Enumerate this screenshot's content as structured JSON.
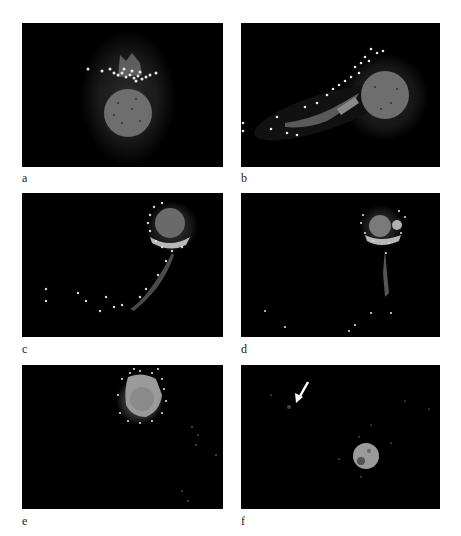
{
  "figure": {
    "panels": [
      {
        "id": "a",
        "label": "a",
        "box": {
          "x": 22,
          "y": 23,
          "w": 201,
          "h": 144
        },
        "disk": {
          "cx": 106,
          "cy": 90,
          "r": 24,
          "halo": 46,
          "fill": "#6e6e6e"
        },
        "secondary": {
          "cx": 106,
          "cy": 38,
          "r": 12,
          "fill": "#5a5a5a"
        },
        "description": "Central gray disk with halo; smaller body above with band of white particles"
      },
      {
        "id": "b",
        "label": "b",
        "box": {
          "x": 241,
          "y": 23,
          "w": 199,
          "h": 144
        },
        "disk": {
          "cx": 144,
          "cy": 72,
          "r": 24,
          "halo": 42,
          "fill": "#6e6e6e"
        },
        "description": "Disk with elongated tidal tail of particles extending to the left"
      },
      {
        "id": "c",
        "label": "c",
        "box": {
          "x": 22,
          "y": 193,
          "w": 201,
          "h": 144
        },
        "disk": {
          "cx": 146,
          "cy": 32,
          "r": 15,
          "halo": 24,
          "fill": "#6a6a6a"
        },
        "description": "Disk with bright crescent and long curved tail toward lower left"
      },
      {
        "id": "d",
        "label": "d",
        "box": {
          "x": 241,
          "y": 193,
          "w": 199,
          "h": 144
        },
        "disk": {
          "cx": 139,
          "cy": 33,
          "r": 11,
          "halo": 20,
          "fill": "#7a7a7a"
        },
        "description": "Compact disk with bright blob and narrow vertical stream below"
      },
      {
        "id": "e",
        "label": "e",
        "box": {
          "x": 22,
          "y": 365,
          "w": 201,
          "h": 144
        },
        "disk": {
          "cx": 119,
          "cy": 34,
          "r": 14,
          "halo": 22,
          "fill": "#8a8a8a"
        },
        "description": "Disk surrounded by bright particle cloud"
      },
      {
        "id": "f",
        "label": "f",
        "box": {
          "x": 241,
          "y": 365,
          "w": 199,
          "h": 144
        },
        "disk": {
          "cx": 125,
          "cy": 91,
          "r": 12,
          "halo": 14,
          "fill": "#9a9a9a"
        },
        "arrow": {
          "x1": 67,
          "y1": 17,
          "x2": 56,
          "y2": 37,
          "color": "#ffffff"
        },
        "description": "Small bright disk; arrow pointing to faint object upper left"
      }
    ]
  }
}
